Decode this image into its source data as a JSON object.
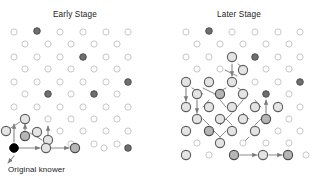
{
  "figure": {
    "title": "Diffusion of Innovation",
    "title_visible": false,
    "caption_knower": "Original knower",
    "panels": [
      {
        "id": "early",
        "label": "Early Stage"
      },
      {
        "id": "later",
        "label": "Later Stage"
      }
    ]
  },
  "colors": {
    "background": "#ffffff",
    "node_unaware_stroke": "#c8c8c8",
    "node_unaware_fill": "#ffffff",
    "node_aware_stroke": "#5e5e5e",
    "node_aware_fill": "#e4e4e4",
    "node_adopter_fill": "#b5b5b5",
    "node_adopter_stroke": "#4a4a4a",
    "node_dark_fill": "#6e6e6e",
    "node_dark_stroke": "#4a4a4a",
    "node_origin_fill": "#000000",
    "node_origin_stroke": "#000000",
    "edge": "#8a8a8a",
    "text": "#1b1b1b"
  },
  "legend_semantics": {
    "unaware": "small light outlined circle — has not heard",
    "aware": "large outlined circle — newly informed",
    "adopter": "gray filled circle — adopted",
    "dark": "dark gray filled circle — isolated early adopter",
    "origin": "black filled circle — original knower"
  },
  "chart_data": {
    "type": "diagram",
    "subtype": "network-diffusion",
    "title": "Diffusion of Innovation",
    "panels": [
      {
        "label": "Early Stage",
        "origin": {
          "x": 14,
          "y": 148
        },
        "counts": {
          "unaware": 44,
          "aware": 5,
          "adopter": 3,
          "dark": 6,
          "origin": 1
        },
        "nodes": [
          {
            "x": 14,
            "y": 32,
            "t": "u"
          },
          {
            "x": 37,
            "y": 31,
            "t": "d"
          },
          {
            "x": 60,
            "y": 32,
            "t": "u"
          },
          {
            "x": 83,
            "y": 32,
            "t": "u"
          },
          {
            "x": 106,
            "y": 32,
            "t": "u"
          },
          {
            "x": 128,
            "y": 32,
            "t": "u"
          },
          {
            "x": 25,
            "y": 44,
            "t": "u"
          },
          {
            "x": 48,
            "y": 44,
            "t": "u"
          },
          {
            "x": 71,
            "y": 44,
            "t": "u"
          },
          {
            "x": 94,
            "y": 44,
            "t": "u"
          },
          {
            "x": 117,
            "y": 44,
            "t": "u"
          },
          {
            "x": 14,
            "y": 57,
            "t": "u"
          },
          {
            "x": 37,
            "y": 57,
            "t": "u"
          },
          {
            "x": 60,
            "y": 57,
            "t": "u"
          },
          {
            "x": 83,
            "y": 57,
            "t": "d"
          },
          {
            "x": 106,
            "y": 57,
            "t": "u"
          },
          {
            "x": 128,
            "y": 57,
            "t": "u"
          },
          {
            "x": 25,
            "y": 69,
            "t": "u"
          },
          {
            "x": 48,
            "y": 69,
            "t": "u"
          },
          {
            "x": 71,
            "y": 69,
            "t": "u"
          },
          {
            "x": 94,
            "y": 69,
            "t": "u"
          },
          {
            "x": 117,
            "y": 69,
            "t": "u"
          },
          {
            "x": 14,
            "y": 82,
            "t": "u"
          },
          {
            "x": 37,
            "y": 82,
            "t": "u"
          },
          {
            "x": 60,
            "y": 82,
            "t": "u"
          },
          {
            "x": 83,
            "y": 82,
            "t": "u"
          },
          {
            "x": 106,
            "y": 82,
            "t": "u"
          },
          {
            "x": 128,
            "y": 82,
            "t": "d"
          },
          {
            "x": 25,
            "y": 94,
            "t": "u"
          },
          {
            "x": 48,
            "y": 94,
            "t": "d"
          },
          {
            "x": 71,
            "y": 94,
            "t": "u"
          },
          {
            "x": 94,
            "y": 94,
            "t": "d"
          },
          {
            "x": 117,
            "y": 94,
            "t": "u"
          },
          {
            "x": 14,
            "y": 107,
            "t": "u"
          },
          {
            "x": 37,
            "y": 107,
            "t": "u"
          },
          {
            "x": 60,
            "y": 107,
            "t": "u"
          },
          {
            "x": 83,
            "y": 107,
            "t": "u"
          },
          {
            "x": 106,
            "y": 107,
            "t": "u"
          },
          {
            "x": 128,
            "y": 107,
            "t": "u"
          },
          {
            "x": 25,
            "y": 119,
            "t": "a"
          },
          {
            "x": 48,
            "y": 119,
            "t": "u"
          },
          {
            "x": 71,
            "y": 119,
            "t": "u"
          },
          {
            "x": 94,
            "y": 119,
            "t": "u"
          },
          {
            "x": 117,
            "y": 119,
            "t": "u"
          },
          {
            "x": 6,
            "y": 131,
            "t": "a"
          },
          {
            "x": 37,
            "y": 132,
            "t": "a"
          },
          {
            "x": 60,
            "y": 131,
            "t": "u"
          },
          {
            "x": 83,
            "y": 131,
            "t": "u"
          },
          {
            "x": 106,
            "y": 131,
            "t": "u"
          },
          {
            "x": 128,
            "y": 131,
            "t": "u"
          },
          {
            "x": 25,
            "y": 136,
            "t": "p"
          },
          {
            "x": 48,
            "y": 140,
            "t": "a"
          },
          {
            "x": 71,
            "y": 144,
            "t": "u"
          },
          {
            "x": 94,
            "y": 144,
            "t": "u"
          },
          {
            "x": 117,
            "y": 144,
            "t": "u"
          },
          {
            "x": 14,
            "y": 148,
            "t": "o"
          },
          {
            "x": 46,
            "y": 148,
            "t": "a"
          },
          {
            "x": 75,
            "y": 148,
            "t": "p"
          },
          {
            "x": 104,
            "y": 148,
            "t": "u"
          },
          {
            "x": 128,
            "y": 148,
            "t": "d"
          }
        ],
        "edges": [
          {
            "from": [
              14,
              148
            ],
            "to": [
              40,
              148
            ],
            "arrow": true
          },
          {
            "from": [
              46,
              148
            ],
            "to": [
              69,
              148
            ],
            "arrow": true
          },
          {
            "from": [
              14,
              142
            ],
            "to": [
              14,
              124
            ],
            "arrow": true
          },
          {
            "from": [
              25,
              130
            ],
            "to": [
              25,
              124
            ],
            "arrow": true
          },
          {
            "from": [
              48,
              140
            ],
            "to": [
              48,
              126
            ],
            "arrow": true
          },
          {
            "from": [
              6,
              131
            ],
            "to": [
              20,
              122
            ],
            "arrow": false
          },
          {
            "from": [
              30,
              133
            ],
            "to": [
              42,
              140
            ],
            "arrow": false
          },
          {
            "from": [
              14,
              156
            ],
            "to": [
              8,
              163
            ],
            "arrow": true
          }
        ]
      },
      {
        "label": "Later Stage",
        "counts": {
          "unaware": 22,
          "aware": 16,
          "adopter": 14,
          "dark": 5,
          "origin": 0
        },
        "nodes": [
          {
            "x": 186,
            "y": 32,
            "t": "u"
          },
          {
            "x": 209,
            "y": 31,
            "t": "d"
          },
          {
            "x": 232,
            "y": 32,
            "t": "u"
          },
          {
            "x": 255,
            "y": 32,
            "t": "u"
          },
          {
            "x": 278,
            "y": 32,
            "t": "u"
          },
          {
            "x": 300,
            "y": 32,
            "t": "u"
          },
          {
            "x": 197,
            "y": 44,
            "t": "u"
          },
          {
            "x": 220,
            "y": 44,
            "t": "u"
          },
          {
            "x": 243,
            "y": 44,
            "t": "u"
          },
          {
            "x": 266,
            "y": 44,
            "t": "u"
          },
          {
            "x": 289,
            "y": 44,
            "t": "u"
          },
          {
            "x": 186,
            "y": 57,
            "t": "u"
          },
          {
            "x": 209,
            "y": 57,
            "t": "u"
          },
          {
            "x": 232,
            "y": 57,
            "t": "a"
          },
          {
            "x": 255,
            "y": 57,
            "t": "d"
          },
          {
            "x": 278,
            "y": 57,
            "t": "u"
          },
          {
            "x": 300,
            "y": 57,
            "t": "u"
          },
          {
            "x": 197,
            "y": 69,
            "t": "u"
          },
          {
            "x": 220,
            "y": 69,
            "t": "u"
          },
          {
            "x": 243,
            "y": 70,
            "t": "a"
          },
          {
            "x": 266,
            "y": 69,
            "t": "u"
          },
          {
            "x": 289,
            "y": 69,
            "t": "u"
          },
          {
            "x": 186,
            "y": 82,
            "t": "a"
          },
          {
            "x": 209,
            "y": 82,
            "t": "a"
          },
          {
            "x": 232,
            "y": 82,
            "t": "a"
          },
          {
            "x": 255,
            "y": 82,
            "t": "u"
          },
          {
            "x": 278,
            "y": 82,
            "t": "u"
          },
          {
            "x": 300,
            "y": 82,
            "t": "d"
          },
          {
            "x": 197,
            "y": 94,
            "t": "a"
          },
          {
            "x": 220,
            "y": 94,
            "t": "p"
          },
          {
            "x": 243,
            "y": 94,
            "t": "a"
          },
          {
            "x": 266,
            "y": 94,
            "t": "d"
          },
          {
            "x": 289,
            "y": 94,
            "t": "u"
          },
          {
            "x": 186,
            "y": 107,
            "t": "a"
          },
          {
            "x": 209,
            "y": 107,
            "t": "a"
          },
          {
            "x": 232,
            "y": 107,
            "t": "a"
          },
          {
            "x": 255,
            "y": 107,
            "t": "a"
          },
          {
            "x": 278,
            "y": 107,
            "t": "a"
          },
          {
            "x": 300,
            "y": 107,
            "t": "u"
          },
          {
            "x": 197,
            "y": 119,
            "t": "a"
          },
          {
            "x": 220,
            "y": 119,
            "t": "a"
          },
          {
            "x": 243,
            "y": 119,
            "t": "a"
          },
          {
            "x": 266,
            "y": 119,
            "t": "p"
          },
          {
            "x": 289,
            "y": 119,
            "t": "u"
          },
          {
            "x": 186,
            "y": 131,
            "t": "a"
          },
          {
            "x": 209,
            "y": 131,
            "t": "p"
          },
          {
            "x": 232,
            "y": 131,
            "t": "a"
          },
          {
            "x": 255,
            "y": 131,
            "t": "a"
          },
          {
            "x": 278,
            "y": 131,
            "t": "u"
          },
          {
            "x": 300,
            "y": 131,
            "t": "u"
          },
          {
            "x": 197,
            "y": 143,
            "t": "u"
          },
          {
            "x": 220,
            "y": 143,
            "t": "a"
          },
          {
            "x": 243,
            "y": 143,
            "t": "u"
          },
          {
            "x": 266,
            "y": 143,
            "t": "u"
          },
          {
            "x": 289,
            "y": 143,
            "t": "u"
          },
          {
            "x": 186,
            "y": 155,
            "t": "a"
          },
          {
            "x": 209,
            "y": 155,
            "t": "u"
          },
          {
            "x": 234,
            "y": 155,
            "t": "p"
          },
          {
            "x": 263,
            "y": 155,
            "t": "a"
          },
          {
            "x": 288,
            "y": 155,
            "t": "p"
          },
          {
            "x": 306,
            "y": 155,
            "t": "u"
          }
        ],
        "edges": [
          {
            "from": [
              232,
              64
            ],
            "to": [
              232,
              76
            ],
            "arrow": true
          },
          {
            "from": [
              238,
              64
            ],
            "to": [
              246,
              70
            ],
            "arrow": false
          },
          {
            "from": [
              237,
              76
            ],
            "to": [
              225,
              70
            ],
            "arrow": false
          },
          {
            "from": [
              192,
              88
            ],
            "to": [
              203,
              94
            ],
            "arrow": false
          },
          {
            "from": [
              203,
              88
            ],
            "to": [
              215,
              94
            ],
            "arrow": false
          },
          {
            "from": [
              226,
              88
            ],
            "to": [
              215,
              94
            ],
            "arrow": false
          },
          {
            "from": [
              238,
              88
            ],
            "to": [
              248,
              94
            ],
            "arrow": false
          },
          {
            "from": [
              186,
              88
            ],
            "to": [
              186,
              101
            ],
            "arrow": true
          },
          {
            "from": [
              197,
              100
            ],
            "to": [
              197,
              113
            ],
            "arrow": true
          },
          {
            "from": [
              209,
              100
            ],
            "to": [
              203,
              107
            ],
            "arrow": false
          },
          {
            "from": [
              220,
              100
            ],
            "to": [
              226,
              107
            ],
            "arrow": false
          },
          {
            "from": [
              243,
              100
            ],
            "to": [
              237,
              107
            ],
            "arrow": false
          },
          {
            "from": [
              255,
              100
            ],
            "to": [
              261,
              107
            ],
            "arrow": false
          },
          {
            "from": [
              232,
              113
            ],
            "to": [
              226,
              119
            ],
            "arrow": false
          },
          {
            "from": [
              243,
              113
            ],
            "to": [
              249,
              119
            ],
            "arrow": false
          },
          {
            "from": [
              266,
              113
            ],
            "to": [
              266,
              100
            ],
            "arrow": true
          },
          {
            "from": [
              209,
              125
            ],
            "to": [
              203,
              119
            ],
            "arrow": false
          },
          {
            "from": [
              220,
              125
            ],
            "to": [
              226,
              119
            ],
            "arrow": false
          },
          {
            "from": [
              232,
              125
            ],
            "to": [
              226,
              119
            ],
            "arrow": false
          },
          {
            "from": [
              255,
              125
            ],
            "to": [
              261,
              119
            ],
            "arrow": false
          },
          {
            "from": [
              220,
              137
            ],
            "to": [
              214,
              131
            ],
            "arrow": false
          },
          {
            "from": [
              220,
              137
            ],
            "to": [
              226,
              131
            ],
            "arrow": false
          },
          {
            "from": [
              243,
              143
            ],
            "to": [
              249,
              137
            ],
            "arrow": false
          },
          {
            "from": [
              240,
              155
            ],
            "to": [
              257,
              155
            ],
            "arrow": true
          },
          {
            "from": [
              269,
              155
            ],
            "to": [
              282,
              155
            ],
            "arrow": true
          }
        ]
      }
    ]
  }
}
